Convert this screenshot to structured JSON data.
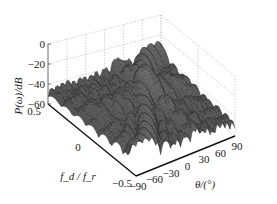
{
  "chart_data": {
    "type": "surface3d",
    "title": "",
    "zlabel": "P(ω)/dB",
    "ylabel": "f_d / f_r",
    "xlabel": "θ/(°)",
    "x_ticks": [
      "−90",
      "−60",
      "−30",
      "0",
      "30",
      "60",
      "90"
    ],
    "x_tick_values": [
      -90,
      -60,
      -30,
      0,
      30,
      60,
      90
    ],
    "y_ticks": [
      "0.5",
      "0",
      "−0.5"
    ],
    "y_tick_values": [
      0.5,
      0,
      -0.5
    ],
    "z_ticks": [
      "0",
      "−20",
      "−40",
      "−60"
    ],
    "z_tick_values": [
      0,
      -20,
      -40,
      -60
    ],
    "xlim": [
      -90,
      90
    ],
    "ylim": [
      -0.5,
      0.5
    ],
    "zlim": [
      -60,
      0
    ],
    "grid": true,
    "surface_color": "#555555",
    "main_peak": {
      "theta": 20,
      "fd": 0.1,
      "level_db": -17
    },
    "clutter_ridge": {
      "description": "diagonal ridge from (θ=-90, f=-0.5) to (θ=90, f=0.5)",
      "level_db": -26
    },
    "sidelobe_floor_db": -45
  }
}
